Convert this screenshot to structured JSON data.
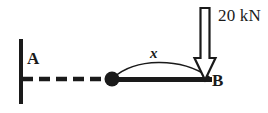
{
  "diagram": {
    "type": "beam-free-body-diagram",
    "background_color": "#ffffff",
    "stroke_color": "#1a1a1a",
    "labels": {
      "support_point": "A",
      "free_end_point": "B",
      "distance_variable": "x",
      "point_load": "20 kN"
    },
    "elements": {
      "wall": {
        "name": "fixed-support-wall",
        "x": 21,
        "y_top": 39,
        "y_bottom": 104,
        "thickness": 4
      },
      "dashed_axis": {
        "name": "dashed-reference-line",
        "x_start": 22,
        "x_end": 112,
        "y": 79,
        "dash": "11 6",
        "thickness": 4
      },
      "node": {
        "name": "hinge-node",
        "cx": 112,
        "cy": 79,
        "r": 7
      },
      "beam": {
        "name": "beam-member",
        "x_start": 112,
        "x_end": 212,
        "y": 79,
        "thickness": 5
      },
      "arc": {
        "name": "deflection-arc",
        "x_start": 112,
        "x_end": 209,
        "y_baseline": 78,
        "peak_y": 62
      },
      "load_arrow": {
        "name": "point-load-arrow",
        "x_center": 205,
        "y_top": 8,
        "y_tip": 80,
        "shaft_width": 9,
        "head_width": 21,
        "head_height": 22,
        "fill": "#ffffff",
        "outline": "#1a1a1a",
        "direction": "down"
      }
    }
  }
}
